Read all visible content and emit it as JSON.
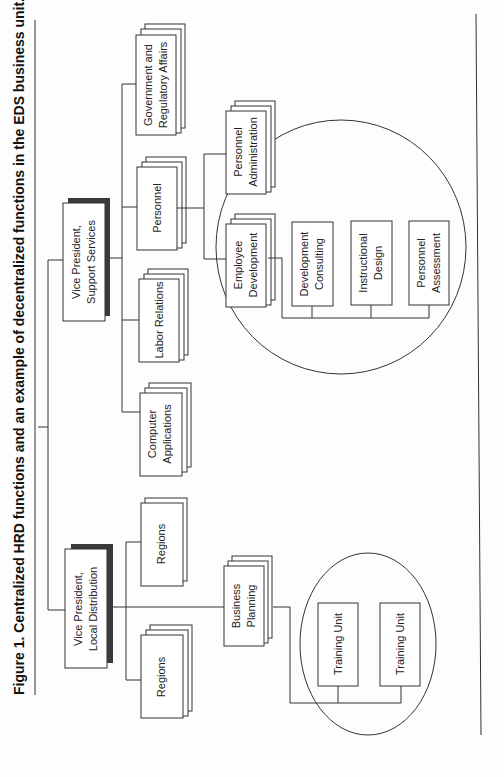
{
  "figure": {
    "title": "Figure 1. Centralized HRD functions and an example of decentralized functions in the EDS business unit."
  },
  "nodes": {
    "vp_support": {
      "line1": "Vice President,",
      "line2": "Support Services"
    },
    "vp_local": {
      "line1": "Vice President,",
      "line2": "Local Distribution"
    },
    "computer_apps": {
      "line1": "Computer",
      "line2": "Applications"
    },
    "labor_relations": {
      "line1": "Labor Relations"
    },
    "personnel": {
      "line1": "Personnel"
    },
    "gov_affairs": {
      "line1": "Government and",
      "line2": "Regulatory Affairs"
    },
    "employee_dev": {
      "line1": "Employee",
      "line2": "Development"
    },
    "personnel_admin": {
      "line1": "Personnel",
      "line2": "Administration"
    },
    "dev_consulting": {
      "line1": "Development",
      "line2": "Consulting"
    },
    "instructional_design": {
      "line1": "Instructional",
      "line2": "Design"
    },
    "personnel_assessment": {
      "line1": "Personnel",
      "line2": "Assessment"
    },
    "regions_1": {
      "line1": "Regions"
    },
    "regions_2": {
      "line1": "Regions"
    },
    "business_planning": {
      "line1": "Business",
      "line2": "Planning"
    },
    "training_unit_1": {
      "line1": "Training Unit"
    },
    "training_unit_2": {
      "line1": "Training Unit"
    }
  },
  "colors": {
    "line": "#333333",
    "shadow": "#3a3a3a",
    "background": "#fdfdfd"
  }
}
